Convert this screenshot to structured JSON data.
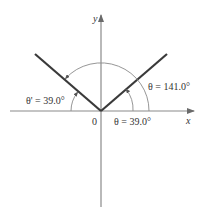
{
  "diagram": {
    "type": "angle-diagram",
    "axes": {
      "x_label": "x",
      "y_label": "y",
      "origin_label": "0"
    },
    "rays": [
      {
        "name": "terminal-ray",
        "angle_deg": 141.0
      },
      {
        "name": "reflected-ray",
        "angle_deg": 39.0
      }
    ],
    "labels": {
      "theta_prime": "θ' = 39.0°",
      "theta_large": "θ = 141.0°",
      "theta_small": "θ = 39.0°"
    },
    "colors": {
      "axis": "#888888",
      "ray": "#3a3a3a",
      "arc": "#8a8a8a",
      "text": "#333333"
    }
  }
}
